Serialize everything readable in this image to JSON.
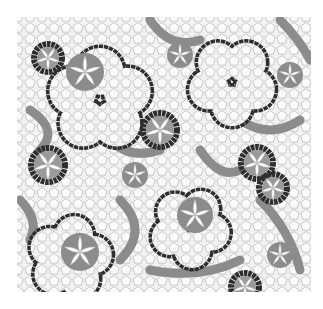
{
  "image": {
    "kind": "decorative quasi-periodic pentagonal tiling",
    "width": 323,
    "height": 309,
    "tiling_bounds": {
      "x": 17,
      "y": 17,
      "width": 294,
      "height": 275
    }
  },
  "colors": {
    "background": "#ffffff",
    "cell_fill": "#f2f2f2",
    "cell_stroke": "#a8a8a8",
    "gray_band": "#8c8c8c",
    "dark_band": "#2e2e2e",
    "petal": "#ffffff"
  },
  "features": {
    "dark_rings": [
      {
        "cx": 100,
        "cy": 100,
        "r": 52,
        "rot": 0
      },
      {
        "cx": 232,
        "cy": 82,
        "r": 44,
        "rot": 36
      },
      {
        "cx": 70,
        "cy": 258,
        "r": 42,
        "rot": 10
      },
      {
        "cx": 190,
        "cy": 228,
        "r": 40,
        "rot": 30
      }
    ],
    "dark_stars": [
      {
        "cx": 160,
        "cy": 130,
        "r": 17
      },
      {
        "cx": 48,
        "cy": 165,
        "r": 17
      },
      {
        "cx": 257,
        "cy": 163,
        "r": 16
      },
      {
        "cx": 273,
        "cy": 188,
        "r": 14
      },
      {
        "cx": 245,
        "cy": 287,
        "r": 14
      },
      {
        "cx": 48,
        "cy": 58,
        "r": 14
      }
    ],
    "gray_flowers": [
      {
        "cx": 85,
        "cy": 72,
        "r": 19
      },
      {
        "cx": 80,
        "cy": 252,
        "r": 19
      },
      {
        "cx": 195,
        "cy": 215,
        "r": 18
      },
      {
        "cx": 135,
        "cy": 175,
        "r": 13
      },
      {
        "cx": 290,
        "cy": 75,
        "r": 13
      },
      {
        "cx": 180,
        "cy": 55,
        "r": 13
      },
      {
        "cx": 280,
        "cy": 255,
        "r": 13
      }
    ],
    "gray_bands": [
      "M30,110 Q60,130 40,150",
      "M150,20 Q170,50 200,40",
      "M120,200 Q150,230 120,260",
      "M240,120 Q270,140 300,120",
      "M260,200 Q290,230 300,270",
      "M150,270 Q200,280 240,260",
      "M20,200 Q40,220 30,240",
      "M200,150 Q220,180 240,170",
      "M280,20 Q300,40 310,60",
      "M110,140 Q130,160 160,150"
    ]
  }
}
